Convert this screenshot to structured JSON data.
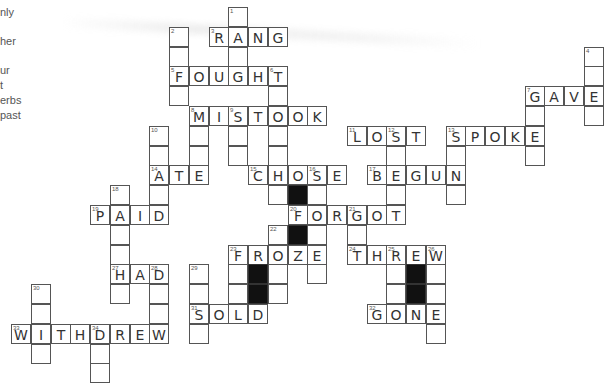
{
  "puzzle": {
    "title": "Past tense verbs crossword",
    "grid_origin": {
      "x": 11,
      "y": 7
    },
    "cell_pitch": {
      "x": 19.75,
      "y": 19.8
    },
    "colors": {
      "line": "#555555",
      "letter": "#333333",
      "black": "#111111",
      "background": "#ffffff"
    }
  },
  "clue_fragments": [
    {
      "text": "nly",
      "y": 6
    },
    {
      "text": "her",
      "y": 35
    },
    {
      "text": "ur",
      "y": 64
    },
    {
      "text": "t",
      "y": 79
    },
    {
      "text": "erbs",
      "y": 94
    },
    {
      "text": "past",
      "y": 109
    }
  ],
  "across_answers": [
    {
      "number": 3,
      "answer": "RANG"
    },
    {
      "number": 5,
      "answer": "FOUGHT"
    },
    {
      "number": 7,
      "answer": "GAVE"
    },
    {
      "number": 8,
      "answer": "MISTOOK"
    },
    {
      "number": 11,
      "answer": "LOST"
    },
    {
      "number": 13,
      "answer": "SPOKE"
    },
    {
      "number": 14,
      "answer": "ATE"
    },
    {
      "number": 15,
      "answer": "CHOSE"
    },
    {
      "number": 17,
      "answer": "BEGUN"
    },
    {
      "number": 19,
      "answer": "PAID"
    },
    {
      "number": 20,
      "answer": "FORGOT"
    },
    {
      "number": 23,
      "answer": "FROZE"
    },
    {
      "number": 24,
      "answer": "THREW"
    },
    {
      "number": 27,
      "answer": "HAD"
    },
    {
      "number": 31,
      "answer": "SOLD"
    },
    {
      "number": 32,
      "answer": "GONE"
    },
    {
      "number": 33,
      "answer": "WITHDREW"
    }
  ],
  "cells": [
    {
      "r": 0,
      "c": 11,
      "n": "1"
    },
    {
      "r": 1,
      "c": 8,
      "n": "2"
    },
    {
      "r": 1,
      "c": 10,
      "n": "3",
      "l": "R"
    },
    {
      "r": 1,
      "c": 11,
      "l": "A"
    },
    {
      "r": 1,
      "c": 12,
      "l": "N"
    },
    {
      "r": 1,
      "c": 13,
      "l": "G"
    },
    {
      "r": 2,
      "c": 8
    },
    {
      "r": 2,
      "c": 11
    },
    {
      "r": 2,
      "c": 29,
      "n": "4"
    },
    {
      "r": 3,
      "c": 8,
      "n": "5",
      "l": "F"
    },
    {
      "r": 3,
      "c": 9,
      "l": "O"
    },
    {
      "r": 3,
      "c": 10,
      "l": "U"
    },
    {
      "r": 3,
      "c": 11,
      "l": "G"
    },
    {
      "r": 3,
      "c": 12,
      "l": "H"
    },
    {
      "r": 3,
      "c": 13,
      "n": "6",
      "l": "T"
    },
    {
      "r": 3,
      "c": 29
    },
    {
      "r": 4,
      "c": 8
    },
    {
      "r": 4,
      "c": 13
    },
    {
      "r": 4,
      "c": 26,
      "n": "7",
      "l": "G"
    },
    {
      "r": 4,
      "c": 27,
      "l": "A"
    },
    {
      "r": 4,
      "c": 28,
      "l": "V"
    },
    {
      "r": 4,
      "c": 29,
      "l": "E"
    },
    {
      "r": 5,
      "c": 9,
      "n": "8",
      "l": "M"
    },
    {
      "r": 5,
      "c": 10,
      "l": "I"
    },
    {
      "r": 5,
      "c": 11,
      "n": "9",
      "l": "S"
    },
    {
      "r": 5,
      "c": 12,
      "l": "T"
    },
    {
      "r": 5,
      "c": 13,
      "l": "O"
    },
    {
      "r": 5,
      "c": 14,
      "l": "O"
    },
    {
      "r": 5,
      "c": 15,
      "l": "K"
    },
    {
      "r": 5,
      "c": 26
    },
    {
      "r": 5,
      "c": 29
    },
    {
      "r": 6,
      "c": 7,
      "n": "10"
    },
    {
      "r": 6,
      "c": 9
    },
    {
      "r": 6,
      "c": 11
    },
    {
      "r": 6,
      "c": 13
    },
    {
      "r": 6,
      "c": 17,
      "n": "11",
      "l": "L"
    },
    {
      "r": 6,
      "c": 18,
      "l": "O"
    },
    {
      "r": 6,
      "c": 19,
      "n": "12",
      "l": "S"
    },
    {
      "r": 6,
      "c": 20,
      "l": "T"
    },
    {
      "r": 6,
      "c": 22,
      "n": "13",
      "l": "S"
    },
    {
      "r": 6,
      "c": 23,
      "l": "P"
    },
    {
      "r": 6,
      "c": 24,
      "l": "O"
    },
    {
      "r": 6,
      "c": 25,
      "l": "K"
    },
    {
      "r": 6,
      "c": 26,
      "l": "E"
    },
    {
      "r": 7,
      "c": 7
    },
    {
      "r": 7,
      "c": 9
    },
    {
      "r": 7,
      "c": 11
    },
    {
      "r": 7,
      "c": 13
    },
    {
      "r": 7,
      "c": 19
    },
    {
      "r": 7,
      "c": 22
    },
    {
      "r": 7,
      "c": 26
    },
    {
      "r": 8,
      "c": 7,
      "n": "14",
      "l": "A"
    },
    {
      "r": 8,
      "c": 8,
      "l": "T"
    },
    {
      "r": 8,
      "c": 9,
      "l": "E"
    },
    {
      "r": 8,
      "c": 12,
      "n": "15",
      "l": "C"
    },
    {
      "r": 8,
      "c": 13,
      "l": "H"
    },
    {
      "r": 8,
      "c": 14,
      "l": "O"
    },
    {
      "r": 8,
      "c": 15,
      "n": "16",
      "l": "S"
    },
    {
      "r": 8,
      "c": 16,
      "l": "E"
    },
    {
      "r": 8,
      "c": 18,
      "n": "17",
      "l": "B"
    },
    {
      "r": 8,
      "c": 19,
      "l": "E"
    },
    {
      "r": 8,
      "c": 20,
      "l": "G"
    },
    {
      "r": 8,
      "c": 21,
      "l": "U"
    },
    {
      "r": 8,
      "c": 22,
      "l": "N"
    },
    {
      "r": 9,
      "c": 5,
      "n": "18"
    },
    {
      "r": 9,
      "c": 7
    },
    {
      "r": 9,
      "c": 13
    },
    {
      "r": 9,
      "c": 14,
      "b": true
    },
    {
      "r": 9,
      "c": 15
    },
    {
      "r": 9,
      "c": 19
    },
    {
      "r": 9,
      "c": 22
    },
    {
      "r": 10,
      "c": 4,
      "n": "19",
      "l": "P"
    },
    {
      "r": 10,
      "c": 5,
      "l": "A"
    },
    {
      "r": 10,
      "c": 6,
      "l": "I"
    },
    {
      "r": 10,
      "c": 7,
      "l": "D"
    },
    {
      "r": 10,
      "c": 14,
      "n": "20",
      "l": "F"
    },
    {
      "r": 10,
      "c": 15,
      "l": "O"
    },
    {
      "r": 10,
      "c": 16,
      "l": "R"
    },
    {
      "r": 10,
      "c": 17,
      "n": "21",
      "l": "G"
    },
    {
      "r": 10,
      "c": 18,
      "l": "O"
    },
    {
      "r": 10,
      "c": 19,
      "l": "T"
    },
    {
      "r": 11,
      "c": 5
    },
    {
      "r": 11,
      "c": 13,
      "n": "22"
    },
    {
      "r": 11,
      "c": 14,
      "b": true
    },
    {
      "r": 11,
      "c": 15
    },
    {
      "r": 11,
      "c": 17
    },
    {
      "r": 12,
      "c": 5
    },
    {
      "r": 12,
      "c": 11,
      "n": "23",
      "l": "F"
    },
    {
      "r": 12,
      "c": 12,
      "l": "R"
    },
    {
      "r": 12,
      "c": 13,
      "l": "O"
    },
    {
      "r": 12,
      "c": 14,
      "l": "Z"
    },
    {
      "r": 12,
      "c": 15,
      "l": "E"
    },
    {
      "r": 12,
      "c": 17,
      "n": "24",
      "l": "T"
    },
    {
      "r": 12,
      "c": 18,
      "l": "H"
    },
    {
      "r": 12,
      "c": 19,
      "n": "25",
      "l": "R"
    },
    {
      "r": 12,
      "c": 20,
      "l": "E"
    },
    {
      "r": 12,
      "c": 21,
      "n": "26",
      "l": "W"
    },
    {
      "r": 13,
      "c": 5,
      "n": "27",
      "l": "H"
    },
    {
      "r": 13,
      "c": 6,
      "l": "A"
    },
    {
      "r": 13,
      "c": 7,
      "n": "28",
      "l": "D"
    },
    {
      "r": 13,
      "c": 9,
      "n": "29"
    },
    {
      "r": 13,
      "c": 11
    },
    {
      "r": 13,
      "c": 12,
      "b": true
    },
    {
      "r": 13,
      "c": 13
    },
    {
      "r": 13,
      "c": 15
    },
    {
      "r": 13,
      "c": 19
    },
    {
      "r": 13,
      "c": 20,
      "b": true
    },
    {
      "r": 13,
      "c": 21
    },
    {
      "r": 14,
      "c": 1,
      "n": "30"
    },
    {
      "r": 14,
      "c": 5
    },
    {
      "r": 14,
      "c": 7
    },
    {
      "r": 14,
      "c": 9
    },
    {
      "r": 14,
      "c": 11
    },
    {
      "r": 14,
      "c": 12,
      "b": true
    },
    {
      "r": 14,
      "c": 13
    },
    {
      "r": 14,
      "c": 19
    },
    {
      "r": 14,
      "c": 20,
      "b": true
    },
    {
      "r": 14,
      "c": 21
    },
    {
      "r": 15,
      "c": 1
    },
    {
      "r": 15,
      "c": 7
    },
    {
      "r": 15,
      "c": 9,
      "n": "31",
      "l": "S"
    },
    {
      "r": 15,
      "c": 10,
      "l": "O"
    },
    {
      "r": 15,
      "c": 11,
      "l": "L"
    },
    {
      "r": 15,
      "c": 12,
      "l": "D"
    },
    {
      "r": 15,
      "c": 18,
      "n": "32",
      "l": "G"
    },
    {
      "r": 15,
      "c": 19,
      "l": "O"
    },
    {
      "r": 15,
      "c": 20,
      "l": "N"
    },
    {
      "r": 15,
      "c": 21,
      "l": "E"
    },
    {
      "r": 16,
      "c": 0,
      "n": "33",
      "l": "W"
    },
    {
      "r": 16,
      "c": 1,
      "l": "I"
    },
    {
      "r": 16,
      "c": 2,
      "l": "T"
    },
    {
      "r": 16,
      "c": 3,
      "l": "H"
    },
    {
      "r": 16,
      "c": 4,
      "n": "34",
      "l": "D"
    },
    {
      "r": 16,
      "c": 5,
      "l": "R"
    },
    {
      "r": 16,
      "c": 6,
      "l": "E"
    },
    {
      "r": 16,
      "c": 7,
      "l": "W"
    },
    {
      "r": 16,
      "c": 9
    },
    {
      "r": 16,
      "c": 21
    },
    {
      "r": 17,
      "c": 1
    },
    {
      "r": 17,
      "c": 4
    },
    {
      "r": 18,
      "c": 4
    }
  ]
}
